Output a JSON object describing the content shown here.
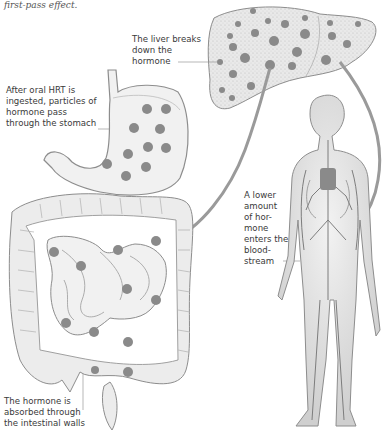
{
  "caption": "first-pass effect.",
  "labels": {
    "liver": [
      "The liver breaks",
      "down the",
      "hormone"
    ],
    "stomach": [
      "After oral HRT is",
      "ingested, particles of",
      "hormone pass",
      "through the stomach"
    ],
    "bloodstream": [
      "A lower",
      "amount",
      "of hor-",
      "mone",
      "enters the",
      "blood-",
      "stream"
    ],
    "intestine": [
      "The hormone is",
      "absorbed through",
      "the intestinal walls"
    ]
  },
  "colors": {
    "particle": "#8a8a8a",
    "organ_fill": "#e8e8e8",
    "organ_stroke": "#9a9a9a",
    "pathway": "#8f8f8f",
    "text": "#3a3a3a"
  },
  "figures": [
    "liver",
    "stomach",
    "intestines",
    "human-body-circulatory-system"
  ]
}
